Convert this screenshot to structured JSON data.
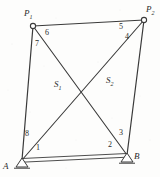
{
  "figure": {
    "type": "structural-truss-diagram",
    "background_color": "#fdfdfc",
    "line_color": "#3a3a3a",
    "label_color": "#2b2b2b",
    "nodes": [
      {
        "id": "P1",
        "label": "P",
        "subscript": "1",
        "x": 33,
        "y": 26,
        "marker": "open-circle",
        "label_x": 24,
        "label_y": 9
      },
      {
        "id": "P2",
        "label": "P",
        "subscript": "2",
        "x": 144,
        "y": 20,
        "marker": "open-circle",
        "label_x": 146,
        "label_y": 5
      },
      {
        "id": "A",
        "label": "A",
        "subscript": "",
        "x": 22,
        "y": 160,
        "marker": "pin-support-triangle",
        "label_x": 3,
        "label_y": 162
      },
      {
        "id": "B",
        "label": "B",
        "subscript": "",
        "x": 127,
        "y": 155,
        "marker": "pin-support-triangle",
        "label_x": 134,
        "label_y": 152
      }
    ],
    "members": [
      {
        "id": "m-top",
        "from": "P1",
        "to": "P2",
        "style": "single"
      },
      {
        "id": "m-left",
        "from": "P1",
        "to": "A",
        "style": "single"
      },
      {
        "id": "m-right",
        "from": "P2",
        "to": "B",
        "style": "single"
      },
      {
        "id": "m-bottom",
        "from": "A",
        "to": "B",
        "style": "double"
      },
      {
        "id": "m-diag-1",
        "from": "P1",
        "to": "B",
        "style": "single"
      },
      {
        "id": "m-diag-2",
        "from": "P2",
        "to": "A",
        "style": "single"
      }
    ],
    "angle_labels": [
      {
        "id": "angle-1",
        "text": "1",
        "x": 36,
        "y": 144
      },
      {
        "id": "angle-2",
        "text": "2",
        "x": 108,
        "y": 141
      },
      {
        "id": "angle-3",
        "text": "3",
        "x": 119,
        "y": 129
      },
      {
        "id": "angle-4",
        "text": "4",
        "x": 125,
        "y": 33
      },
      {
        "id": "angle-5",
        "text": "5",
        "x": 119,
        "y": 23
      },
      {
        "id": "angle-6",
        "text": "6",
        "x": 45,
        "y": 29
      },
      {
        "id": "angle-7",
        "text": "7",
        "x": 35,
        "y": 40
      },
      {
        "id": "angle-8",
        "text": "8",
        "x": 25,
        "y": 130
      }
    ],
    "area_labels": [
      {
        "id": "area-s1",
        "label": "S",
        "subscript": "1",
        "x": 54,
        "y": 80
      },
      {
        "id": "area-s2",
        "label": "S",
        "subscript": "2",
        "x": 106,
        "y": 76
      }
    ]
  }
}
